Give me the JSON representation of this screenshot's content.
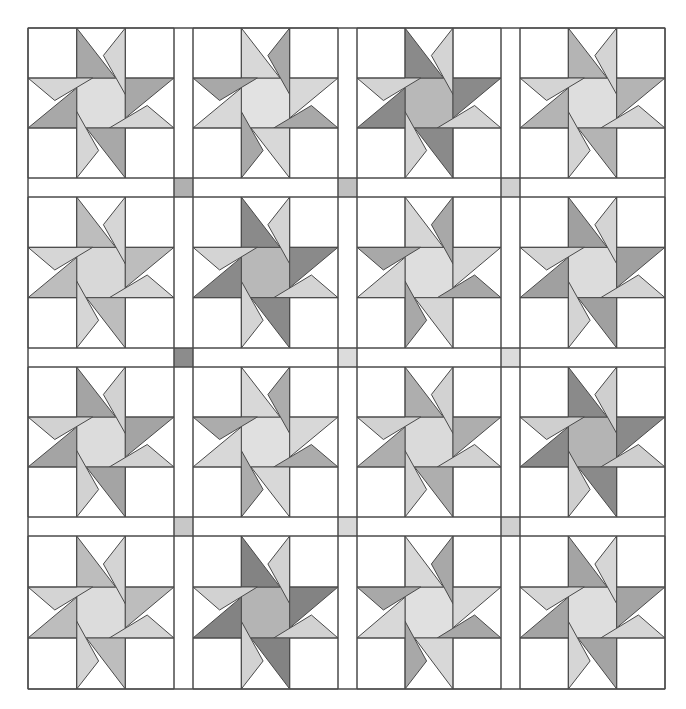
{
  "diagram": {
    "type": "quilt-layout",
    "block_pattern": "twisted-star",
    "grid": {
      "rows": 4,
      "cols": 4
    },
    "bounds": {
      "left": 28,
      "top": 28,
      "right": 665,
      "bottom": 689
    },
    "col_edges": [
      [
        28,
        174
      ],
      [
        193,
        338
      ],
      [
        357,
        501
      ],
      [
        520,
        665
      ]
    ],
    "row_edges": [
      [
        28,
        178
      ],
      [
        197,
        348
      ],
      [
        367,
        517
      ],
      [
        536,
        689
      ]
    ],
    "background": "#ffffff",
    "line_color": "#4a4a4a",
    "blocks": [
      [
        {
          "a": "#a8a8a8",
          "b": "#d6d6d6",
          "c": "#dedede"
        },
        {
          "a": "#d8d8d8",
          "b": "#a8a8a8",
          "c": "#e2e2e2"
        },
        {
          "a": "#8a8a8a",
          "b": "#d4d4d4",
          "c": "#b8b8b8"
        },
        {
          "a": "#b4b4b4",
          "b": "#d4d4d4",
          "c": "#dedede"
        }
      ],
      [
        {
          "a": "#bdbdbd",
          "b": "#d6d6d6",
          "c": "#d8d8d8"
        },
        {
          "a": "#8a8a8a",
          "b": "#d4d4d4",
          "c": "#b8b8b8"
        },
        {
          "a": "#d6d6d6",
          "b": "#a8a8a8",
          "c": "#dedede"
        },
        {
          "a": "#a0a0a0",
          "b": "#d4d4d4",
          "c": "#dcdcdc"
        }
      ],
      [
        {
          "a": "#a4a4a4",
          "b": "#d2d2d2",
          "c": "#dcdcdc"
        },
        {
          "a": "#d8d8d8",
          "b": "#acacac",
          "c": "#e0e0e0"
        },
        {
          "a": "#aeaeae",
          "b": "#d2d2d2",
          "c": "#dadada"
        },
        {
          "a": "#8a8a8a",
          "b": "#cfcfcf",
          "c": "#b4b4b4"
        }
      ],
      [
        {
          "a": "#bdbdbd",
          "b": "#d4d4d4",
          "c": "#dcdcdc"
        },
        {
          "a": "#838383",
          "b": "#d2d2d2",
          "c": "#b4b4b4"
        },
        {
          "a": "#d8d8d8",
          "b": "#a8a8a8",
          "c": "#e0e0e0"
        },
        {
          "a": "#a4a4a4",
          "b": "#d6d6d6",
          "c": "#dedede"
        }
      ]
    ],
    "cornerstones": [
      [
        "#b0b0b0",
        "#c0c0c0",
        "#d0d0d0"
      ],
      [
        "#8c8c8c",
        "#dcdcdc",
        "#dcdcdc"
      ],
      [
        "#c8c8c8",
        "#d8d8d8",
        "#d0d0d0"
      ]
    ]
  }
}
